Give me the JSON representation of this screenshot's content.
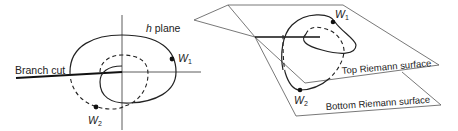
{
  "left_panel": {
    "plane_label_italic": "h",
    "plane_label_rest": " plane",
    "branch_cut_label": "Branch cut",
    "point1": {
      "name": "W",
      "sub": "1"
    },
    "point2": {
      "name": "W",
      "sub": "2"
    }
  },
  "right_panel": {
    "top_surface_label": "Top Riemann surface",
    "bottom_surface_label": "Bottom Riemann surface",
    "point1": {
      "name": "W",
      "sub": "1"
    },
    "point2": {
      "name": "W",
      "sub": "2"
    }
  },
  "colors": {
    "stroke": "#222222",
    "plane_edge": "#444444",
    "background": "#ffffff"
  }
}
